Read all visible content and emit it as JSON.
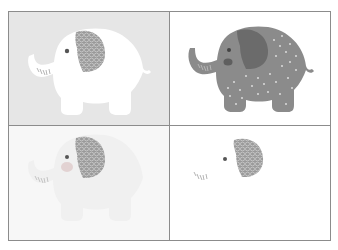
{
  "figure": {
    "colors": {
      "border": "#8c8c8c",
      "tl_background": "#e6e6e6",
      "tl_body": "#ffffff",
      "ear_pattern_fill": "#9a9a9a",
      "ear_pattern_line": "#d2d2d2",
      "tr_background": "#ffffff",
      "tr_body": "#8b8b8b",
      "tr_ear": "#6b6b6b",
      "tr_dots": "#e4e4e4",
      "tr_cheek": "#5f5f5f",
      "bl_background": "#f7f7f7",
      "bl_body": "#f2f2f2",
      "bl_cheek": "#e2d2d2",
      "br_background": "#ffffff",
      "eye": "#555555",
      "trunk_lines": "#b5b5b5"
    },
    "panels": [
      {
        "id": "top-left",
        "label": "White elephant on grey background"
      },
      {
        "id": "top-right",
        "label": "Grey dotted elephant on white background"
      },
      {
        "id": "bottom-left",
        "label": "Faded elephant with patterned ear"
      },
      {
        "id": "bottom-right",
        "label": "Ear, eye and trunk lines only"
      }
    ]
  }
}
